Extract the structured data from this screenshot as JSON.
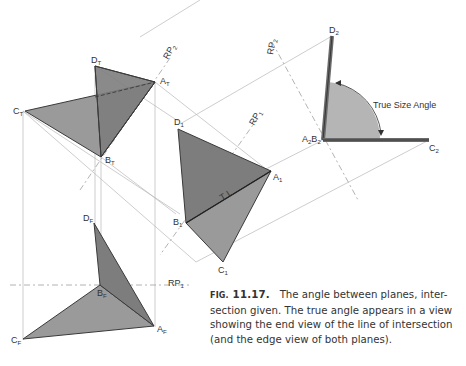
{
  "figure": {
    "number_prefix": "FIG.",
    "number": "11.17.",
    "caption": "The angle between planes, intersection given. The true angle appears in a view showing the end view of the line of intersection (and the edge view of both planes).",
    "caption_lines": [
      "The angle between planes, inter-",
      "section given. The true angle appears in a view",
      "showing the end view of the line of intersection",
      "(and the edge view of both planes)."
    ]
  },
  "labels": {
    "top_view": {
      "D": "D",
      "D_sub": "T",
      "A": "A",
      "A_sub": "T",
      "C": "C",
      "C_sub": "T",
      "B": "B",
      "B_sub": "T"
    },
    "front_view": {
      "D": "D",
      "D_sub": "F",
      "B": "B",
      "B_sub": "F",
      "A": "A",
      "A_sub": "F",
      "C": "C",
      "C_sub": "F"
    },
    "aux1_view": {
      "D": "D",
      "D_sub": "1",
      "A": "A",
      "A_sub": "1",
      "B": "B",
      "B_sub": "1",
      "C": "C",
      "C_sub": "1",
      "true_length": "T L"
    },
    "aux2_view": {
      "D": "D",
      "D_sub": "2",
      "AB": "A",
      "AB_sub1": "2",
      "AB_b": "B",
      "AB_sub2": "2",
      "C": "C",
      "C_sub": "2"
    },
    "reference_planes": {
      "rp1": "RP",
      "rp1_sub": "1",
      "rp2": "RP",
      "rp2_sub": "2"
    },
    "angle_label": "True Size Angle"
  },
  "colors": {
    "plane_fill_dark": "#7d7d7d",
    "plane_fill_light": "#9a9a9a",
    "angle_fill": "#b5b5b5",
    "construction_line": "#b8b8b8",
    "edge_line": "#3a3a3a"
  }
}
